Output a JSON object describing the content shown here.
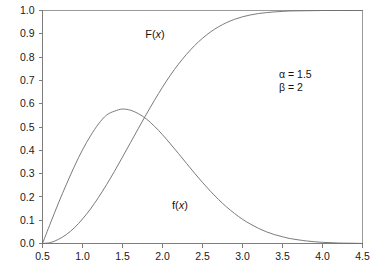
{
  "chart_data": {
    "type": "line",
    "title": "",
    "xlabel": "",
    "ylabel": "",
    "xlim": [
      0.5,
      4.5
    ],
    "ylim": [
      0.0,
      1.0
    ],
    "grid": false,
    "legend_position": "inline-annotation",
    "xticks": [
      "0.5",
      "1.0",
      "1.5",
      "2.0",
      "2.5",
      "3.0",
      "3.5",
      "4.0",
      "4.5"
    ],
    "xtick_values": [
      0.5,
      1.0,
      1.5,
      2.0,
      2.5,
      3.0,
      3.5,
      4.0,
      4.5
    ],
    "yticks": [
      "0.0",
      "0.1",
      "0.2",
      "0.3",
      "0.4",
      "0.5",
      "0.6",
      "0.7",
      "0.8",
      "0.9",
      "1.0"
    ],
    "ytick_values": [
      0.0,
      0.1,
      0.2,
      0.3,
      0.4,
      0.5,
      0.6,
      0.7,
      0.8,
      0.9,
      1.0
    ],
    "series": [
      {
        "name": "F(x)",
        "label_text": "F(x)",
        "role": "cumulative-distribution-function",
        "color": "#6b6b6b",
        "x": [
          0.5,
          0.6,
          0.7,
          0.8,
          0.9,
          1.0,
          1.1,
          1.2,
          1.3,
          1.4,
          1.5,
          1.6,
          1.7,
          1.8,
          1.9,
          2.0,
          2.1,
          2.2,
          2.3,
          2.4,
          2.5,
          2.6,
          2.7,
          2.8,
          2.9,
          3.0,
          3.1,
          3.2,
          3.3,
          3.4,
          3.5,
          3.6,
          3.8,
          4.0,
          4.2,
          4.4,
          4.5
        ],
        "y": [
          0.0,
          0.004,
          0.018,
          0.039,
          0.068,
          0.105,
          0.148,
          0.198,
          0.252,
          0.31,
          0.371,
          0.433,
          0.495,
          0.556,
          0.615,
          0.671,
          0.723,
          0.77,
          0.812,
          0.849,
          0.881,
          0.908,
          0.93,
          0.948,
          0.962,
          0.973,
          0.981,
          0.987,
          0.991,
          0.994,
          0.996,
          0.998,
          0.999,
          1.0,
          1.0,
          1.0,
          1.0
        ]
      },
      {
        "name": "f(x)",
        "label_text": "f(x)",
        "role": "probability-density-function",
        "color": "#6b6b6b",
        "x": [
          0.5,
          0.6,
          0.7,
          0.8,
          0.9,
          1.0,
          1.1,
          1.2,
          1.3,
          1.4,
          1.5,
          1.6,
          1.7,
          1.8,
          1.9,
          2.0,
          2.1,
          2.2,
          2.3,
          2.4,
          2.5,
          2.6,
          2.7,
          2.8,
          2.9,
          3.0,
          3.1,
          3.2,
          3.3,
          3.4,
          3.5,
          3.6,
          3.8,
          4.0,
          4.2,
          4.4,
          4.5
        ],
        "y": [
          0.0,
          0.088,
          0.174,
          0.255,
          0.332,
          0.402,
          0.462,
          0.513,
          0.551,
          0.568,
          0.577,
          0.572,
          0.557,
          0.534,
          0.503,
          0.467,
          0.427,
          0.386,
          0.344,
          0.302,
          0.262,
          0.224,
          0.189,
          0.157,
          0.129,
          0.104,
          0.083,
          0.065,
          0.05,
          0.038,
          0.029,
          0.021,
          0.011,
          0.005,
          0.002,
          0.001,
          0.0
        ]
      }
    ],
    "annotations": [
      {
        "name": "alpha-parameter",
        "symbol": "α",
        "relation": " = ",
        "value": "1.5",
        "text": "α = 1.5"
      },
      {
        "name": "beta-parameter",
        "symbol": "β",
        "relation": " = ",
        "value": "2",
        "text": "β = 2"
      }
    ]
  },
  "labels": {
    "cdf_label_F": "F",
    "cdf_label_paren_open": "(",
    "cdf_label_x": "x",
    "cdf_label_paren_close": ")",
    "pdf_label_f": "f",
    "pdf_label_paren_open": "(",
    "pdf_label_x": "x",
    "pdf_label_paren_close": ")"
  },
  "colors": {
    "curve": "#6b6b6b",
    "axis": "#7d7d7d",
    "frame": "#9a9a9a",
    "text": "#141414",
    "background": "#ffffff"
  }
}
